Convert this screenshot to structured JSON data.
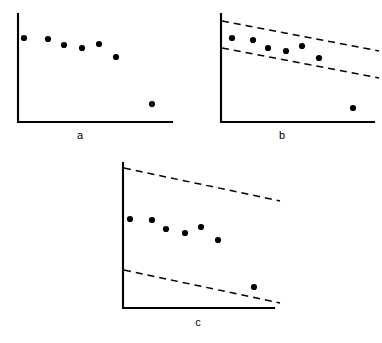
{
  "figure": {
    "type": "multi-panel-scatter",
    "width": 382,
    "height": 343,
    "background_color": "#ffffff",
    "ink_color": "#000000"
  },
  "captions": {
    "a": "a",
    "b": "b",
    "c": "c"
  },
  "chart_data": [
    {
      "id": "panel-a",
      "type": "scatter",
      "title": "a",
      "xlabel": "",
      "ylabel": "",
      "grid": false,
      "legend": false,
      "axes": {
        "origin": [
          18,
          122
        ],
        "x_axis_end": [
          172,
          122
        ],
        "y_axis_top": [
          18,
          14
        ],
        "ticks": false,
        "tick_labels": false
      },
      "series": [
        {
          "name": "observations",
          "marker": "filled-circle",
          "marker_radius": 3.1,
          "color": "#000000",
          "points": [
            [
              24,
              38
            ],
            [
              48,
              39
            ],
            [
              64,
              45
            ],
            [
              82,
              48
            ],
            [
              99,
              44
            ],
            [
              116,
              57
            ],
            [
              152,
              104
            ]
          ]
        }
      ],
      "control_limits": []
    },
    {
      "id": "panel-b",
      "type": "scatter",
      "title": "b",
      "xlabel": "",
      "ylabel": "",
      "grid": false,
      "legend": false,
      "axes": {
        "origin": [
          221,
          122
        ],
        "x_axis_end": [
          374,
          122
        ],
        "y_axis_top": [
          221,
          14
        ],
        "ticks": false,
        "tick_labels": false
      },
      "series": [
        {
          "name": "observations",
          "marker": "filled-circle",
          "marker_radius": 3.1,
          "color": "#000000",
          "points": [
            [
              232,
              38
            ],
            [
              253,
              40
            ],
            [
              268,
              48
            ],
            [
              286,
              51
            ],
            [
              302,
              46
            ],
            [
              319,
              58
            ],
            [
              353,
              108
            ]
          ]
        }
      ],
      "control_limits": [
        {
          "name": "upper-limit",
          "style": "dashed",
          "start": [
            222,
            21
          ],
          "end": [
            379,
            51
          ]
        },
        {
          "name": "lower-limit",
          "style": "dashed",
          "start": [
            222,
            48
          ],
          "end": [
            379,
            78
          ]
        }
      ]
    },
    {
      "id": "panel-c",
      "type": "scatter",
      "title": "c",
      "xlabel": "",
      "ylabel": "",
      "grid": false,
      "legend": false,
      "axes": {
        "origin": [
          123,
          308
        ],
        "x_axis_end": [
          274,
          308
        ],
        "y_axis_top": [
          123,
          163
        ],
        "ticks": false,
        "tick_labels": false
      },
      "series": [
        {
          "name": "observations",
          "marker": "filled-circle",
          "marker_radius": 3.1,
          "color": "#000000",
          "points": [
            [
              130,
              219
            ],
            [
              152,
              220
            ],
            [
              166,
              229
            ],
            [
              185,
              233
            ],
            [
              201,
              227
            ],
            [
              218,
              240
            ],
            [
              254,
              287
            ]
          ]
        }
      ],
      "control_limits": [
        {
          "name": "upper-limit",
          "style": "dashed",
          "start": [
            124,
            168
          ],
          "end": [
            280,
            201
          ]
        },
        {
          "name": "lower-limit",
          "style": "dashed",
          "start": [
            124,
            270
          ],
          "end": [
            280,
            303
          ]
        }
      ]
    }
  ]
}
